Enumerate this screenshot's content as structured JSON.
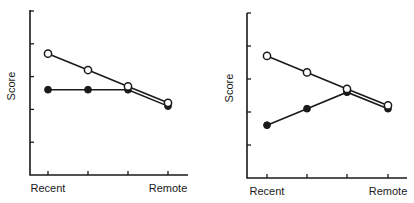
{
  "chart_data": [
    {
      "type": "line",
      "title": "",
      "xlabel": "",
      "ylabel": "Score",
      "categories": [
        "Recent",
        "",
        "",
        "Remote"
      ],
      "x_tick_labels": [
        "Recent",
        "Remote"
      ],
      "y_ticks_unlabeled": 5,
      "ylim": [
        0,
        5
      ],
      "grid": false,
      "legend": null,
      "series": [
        {
          "name": "open-circle",
          "marker": "open",
          "values": [
            3.7,
            3.2,
            2.7,
            2.2
          ]
        },
        {
          "name": "filled-circle",
          "marker": "filled",
          "values": [
            2.6,
            2.6,
            2.6,
            2.1
          ]
        }
      ]
    },
    {
      "type": "line",
      "title": "",
      "xlabel": "",
      "ylabel": "Score",
      "categories": [
        "Recent",
        "",
        "",
        "Remote"
      ],
      "x_tick_labels": [
        "Recent",
        "Remote"
      ],
      "y_ticks_unlabeled": 5,
      "ylim": [
        0,
        5
      ],
      "grid": false,
      "legend": null,
      "series": [
        {
          "name": "open-circle",
          "marker": "open",
          "values": [
            3.7,
            3.2,
            2.7,
            2.2
          ]
        },
        {
          "name": "filled-circle",
          "marker": "filled",
          "values": [
            1.6,
            2.1,
            2.6,
            2.1
          ]
        }
      ]
    }
  ],
  "panels": [
    {
      "ylabel": "Score",
      "x_left_label": "Recent",
      "x_right_label": "Remote",
      "layout": {
        "axisX": 30,
        "axisTop": 10,
        "axisBottom": 175,
        "axisRight": 188,
        "tickXs": [
          48,
          88,
          128,
          168
        ],
        "unit": 32.8,
        "ylabelX": 11,
        "ylabelY": 86,
        "xlabelY": 192
      }
    },
    {
      "ylabel": "Score",
      "x_left_label": "Recent",
      "x_right_label": "Remote",
      "layout": {
        "axisX": 247,
        "axisTop": 13,
        "axisBottom": 178,
        "axisRight": 407,
        "tickXs": [
          267,
          307,
          347,
          388
        ],
        "unit": 33,
        "ylabelX": 229,
        "ylabelY": 88,
        "xlabelY": 195
      }
    }
  ]
}
